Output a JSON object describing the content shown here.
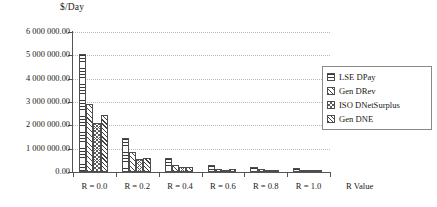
{
  "chart_data": {
    "type": "bar",
    "title": "",
    "ylabel": "$/Day",
    "xlabel": "R Value",
    "categories": [
      "R = 0.0",
      "R = 0.2",
      "R = 0.4",
      "R = 0.6",
      "R = 0.8",
      "R = 1.0"
    ],
    "ylim": [
      0,
      6000000
    ],
    "ytick_values": [
      0,
      1000000,
      2000000,
      3000000,
      4000000,
      5000000,
      6000000
    ],
    "ytick_labels": [
      "0.00",
      "1 000 000.00",
      "2 000 000.00",
      "3 000 000.00",
      "4 000 000.00",
      "5 000 000.00",
      "6 000 000.00"
    ],
    "grid": true,
    "legend_position": "right",
    "series": [
      {
        "name": "LSE DPay",
        "pattern": "horizontal-lines",
        "values": [
          5050000,
          1450000,
          620000,
          290000,
          220000,
          180000
        ]
      },
      {
        "name": "Gen DRev",
        "pattern": "diagonal-lines",
        "values": [
          2900000,
          850000,
          300000,
          150000,
          120000,
          100000
        ]
      },
      {
        "name": "ISO DNetSurplus",
        "pattern": "cross-hatch",
        "values": [
          2100000,
          550000,
          200000,
          95000,
          70000,
          55000
        ]
      },
      {
        "name": "Gen DNE",
        "pattern": "dense-diagonal",
        "values": [
          2450000,
          600000,
          225000,
          110000,
          85000,
          70000
        ]
      }
    ]
  },
  "legend": {
    "items": [
      {
        "label": "LSE DPay"
      },
      {
        "label": "Gen DRev"
      },
      {
        "label": "ISO DNetSurplus"
      },
      {
        "label": "Gen DNE"
      }
    ]
  }
}
